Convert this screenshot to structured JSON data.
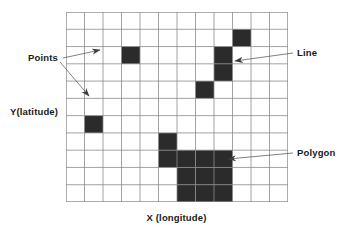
{
  "figure": {
    "title_alt": "Raster representation of points, lines and polygons",
    "colors": {
      "grid_line": "#8c8c8c",
      "cell_fill": "#2b2b2b",
      "background": "#ffffff",
      "text": "#1a1a1a",
      "leader_line": "#4a4a4a"
    }
  },
  "axes": {
    "x_label": "X (longitude)",
    "y_label": "Y(latitude)"
  },
  "annotations": [
    {
      "id": "points",
      "label": "Points",
      "side": "left",
      "arrow_count": 2
    },
    {
      "id": "line",
      "label": "Line",
      "side": "right",
      "arrow_count": 1
    },
    {
      "id": "polygon",
      "label": "Polygon",
      "side": "right",
      "arrow_count": 1
    }
  ],
  "chart_data": {
    "type": "heatmap",
    "title": "",
    "subtitle": "",
    "xlabel": "X (longitude)",
    "ylabel": "Y(latitude)",
    "grid": true,
    "legend_position": "none",
    "cols": 12,
    "rows": 11,
    "xlim": [
      0,
      12
    ],
    "ylim": [
      0,
      11
    ],
    "x_tick_labels": [],
    "y_tick_labels": [],
    "cell_width_px": 18.5,
    "cell_height_px": 17.27,
    "value_legend": {
      "0": "empty cell",
      "1": "filled cell"
    },
    "features": [
      {
        "name": "Points",
        "geometry": "point",
        "cells": [
          {
            "col": 3,
            "row": 2
          },
          {
            "col": 1,
            "row": 6
          }
        ]
      },
      {
        "name": "Line",
        "geometry": "line",
        "cells": [
          {
            "col": 9,
            "row": 1
          },
          {
            "col": 8,
            "row": 2
          },
          {
            "col": 8,
            "row": 3
          },
          {
            "col": 7,
            "row": 4
          }
        ]
      },
      {
        "name": "Polygon",
        "geometry": "polygon",
        "cells": [
          {
            "col": 5,
            "row": 7
          },
          {
            "col": 5,
            "row": 8
          },
          {
            "col": 6,
            "row": 8
          },
          {
            "col": 7,
            "row": 8
          },
          {
            "col": 8,
            "row": 8
          },
          {
            "col": 6,
            "row": 9
          },
          {
            "col": 7,
            "row": 9
          },
          {
            "col": 8,
            "row": 9
          },
          {
            "col": 6,
            "row": 10
          },
          {
            "col": 7,
            "row": 10
          },
          {
            "col": 8,
            "row": 10
          }
        ]
      }
    ],
    "matrix": [
      [
        0,
        0,
        0,
        0,
        0,
        0,
        0,
        0,
        0,
        0,
        0,
        0
      ],
      [
        0,
        0,
        0,
        0,
        0,
        0,
        0,
        0,
        0,
        1,
        0,
        0
      ],
      [
        0,
        0,
        0,
        1,
        0,
        0,
        0,
        0,
        1,
        0,
        0,
        0
      ],
      [
        0,
        0,
        0,
        0,
        0,
        0,
        0,
        0,
        1,
        0,
        0,
        0
      ],
      [
        0,
        0,
        0,
        0,
        0,
        0,
        0,
        1,
        0,
        0,
        0,
        0
      ],
      [
        0,
        0,
        0,
        0,
        0,
        0,
        0,
        0,
        0,
        0,
        0,
        0
      ],
      [
        0,
        1,
        0,
        0,
        0,
        0,
        0,
        0,
        0,
        0,
        0,
        0
      ],
      [
        0,
        0,
        0,
        0,
        0,
        1,
        0,
        0,
        0,
        0,
        0,
        0
      ],
      [
        0,
        0,
        0,
        0,
        0,
        1,
        1,
        1,
        1,
        0,
        0,
        0
      ],
      [
        0,
        0,
        0,
        0,
        0,
        0,
        1,
        1,
        1,
        0,
        0,
        0
      ],
      [
        0,
        0,
        0,
        0,
        0,
        0,
        1,
        1,
        1,
        0,
        0,
        0
      ]
    ]
  }
}
